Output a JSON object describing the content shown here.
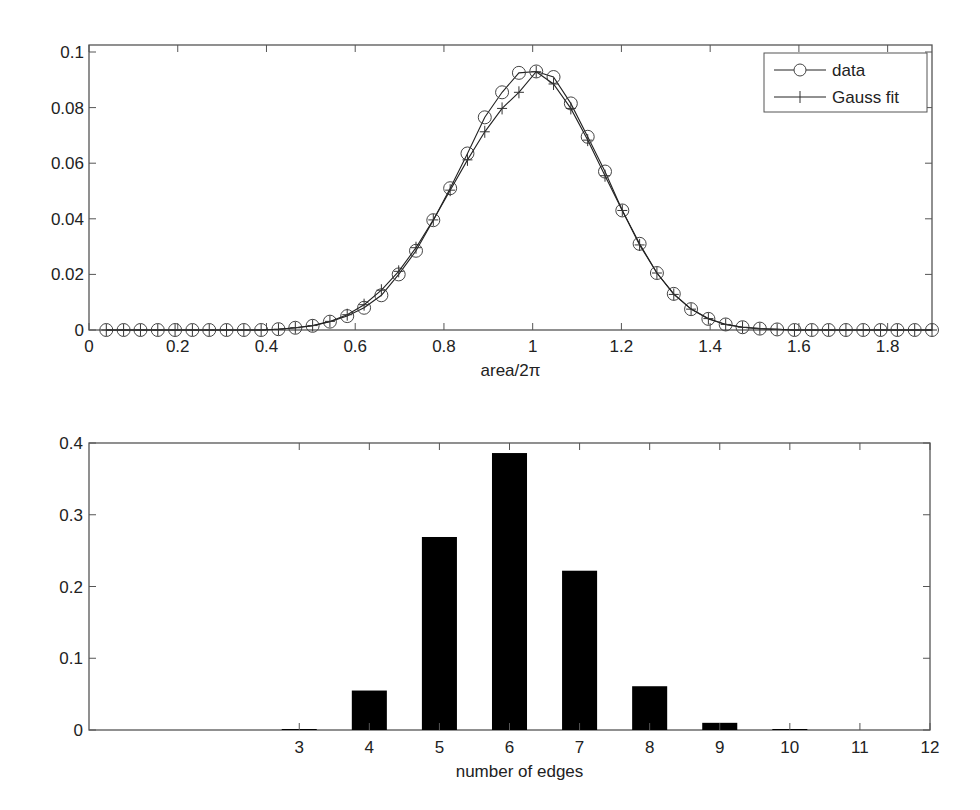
{
  "chart_data": [
    {
      "type": "line",
      "title": "",
      "xlabel": "area/2π",
      "ylabel": "",
      "xlim": [
        0,
        1.9
      ],
      "ylim": [
        0,
        0.1
      ],
      "xticks": [
        0,
        0.2,
        0.4,
        0.6,
        0.8,
        1,
        1.2,
        1.4,
        1.6,
        1.8
      ],
      "xtick_labels": [
        "0",
        "0.2",
        "0.4",
        "0.6",
        "0.8",
        "1",
        "1.2",
        "1.4",
        "1.6",
        "1.8"
      ],
      "yticks": [
        0,
        0.02,
        0.04,
        0.06,
        0.08,
        0.1
      ],
      "ytick_labels": [
        "0",
        "0.02",
        "0.04",
        "0.06",
        "0.08",
        "0.1"
      ],
      "grid": false,
      "legend_position": "upper right",
      "series": [
        {
          "name": "data",
          "marker": "circle",
          "x": [
            0.039,
            0.078,
            0.116,
            0.155,
            0.194,
            0.233,
            0.271,
            0.31,
            0.349,
            0.388,
            0.427,
            0.465,
            0.504,
            0.543,
            0.582,
            0.62,
            0.659,
            0.698,
            0.737,
            0.776,
            0.814,
            0.853,
            0.892,
            0.931,
            0.969,
            1.008,
            1.047,
            1.086,
            1.124,
            1.163,
            1.202,
            1.241,
            1.28,
            1.318,
            1.357,
            1.396,
            1.435,
            1.473,
            1.512,
            1.551,
            1.59,
            1.629,
            1.667,
            1.706,
            1.745,
            1.784,
            1.822,
            1.861,
            1.9
          ],
          "y": [
            0,
            0,
            0,
            0,
            0,
            0,
            0,
            0,
            0,
            0,
            0.0003,
            0.0008,
            0.0015,
            0.003,
            0.005,
            0.008,
            0.0125,
            0.02,
            0.0285,
            0.0395,
            0.051,
            0.0635,
            0.0765,
            0.0855,
            0.0925,
            0.093,
            0.091,
            0.0815,
            0.0695,
            0.057,
            0.043,
            0.031,
            0.0205,
            0.013,
            0.0075,
            0.004,
            0.002,
            0.001,
            0.0005,
            0.0002,
            0,
            0,
            0,
            0,
            0,
            0,
            0,
            0,
            0
          ]
        },
        {
          "name": "Gauss fit",
          "marker": "plus",
          "x": [
            0.039,
            0.078,
            0.116,
            0.155,
            0.194,
            0.233,
            0.271,
            0.31,
            0.349,
            0.388,
            0.427,
            0.465,
            0.504,
            0.543,
            0.582,
            0.62,
            0.659,
            0.698,
            0.737,
            0.776,
            0.814,
            0.853,
            0.892,
            0.931,
            0.969,
            1.008,
            1.047,
            1.086,
            1.124,
            1.163,
            1.202,
            1.241,
            1.28,
            1.318,
            1.357,
            1.396,
            1.435,
            1.473,
            1.512,
            1.551,
            1.59,
            1.629,
            1.667,
            1.706,
            1.745,
            1.784,
            1.822,
            1.861,
            1.9
          ],
          "y": [
            0,
            0,
            0,
            0,
            0,
            0,
            0,
            0,
            0,
            0,
            0.0003,
            0.0008,
            0.0016,
            0.0031,
            0.0055,
            0.0091,
            0.0143,
            0.0211,
            0.0296,
            0.0396,
            0.0503,
            0.0612,
            0.0713,
            0.0797,
            0.0855,
            0.0929,
            0.0885,
            0.0797,
            0.0683,
            0.0555,
            0.043,
            0.0306,
            0.0205,
            0.0128,
            0.0075,
            0.0041,
            0.002,
            0.001,
            0.0005,
            0.0002,
            0,
            0,
            0,
            0,
            0,
            0,
            0,
            0,
            0
          ]
        }
      ]
    },
    {
      "type": "bar",
      "title": "",
      "xlabel": "number of edges",
      "ylabel": "",
      "xlim": [
        0,
        12
      ],
      "ylim": [
        0,
        0.4
      ],
      "xticks": [
        3,
        4,
        5,
        6,
        7,
        8,
        9,
        10,
        11,
        12
      ],
      "xtick_labels": [
        "3",
        "4",
        "5",
        "6",
        "7",
        "8",
        "9",
        "10",
        "11",
        "12"
      ],
      "yticks": [
        0,
        0.1,
        0.2,
        0.3,
        0.4
      ],
      "ytick_labels": [
        "0",
        "0.1",
        "0.2",
        "0.3",
        "0.4"
      ],
      "grid": false,
      "categories": [
        3,
        4,
        5,
        6,
        7,
        8,
        9,
        10,
        11
      ],
      "values": [
        0.001,
        0.055,
        0.269,
        0.386,
        0.222,
        0.061,
        0.01,
        0.0005,
        0
      ],
      "bar_color": "#000000"
    }
  ],
  "colors": {
    "axis": "#555555",
    "line": "#222222",
    "bar": "#000000",
    "background": "#ffffff"
  }
}
